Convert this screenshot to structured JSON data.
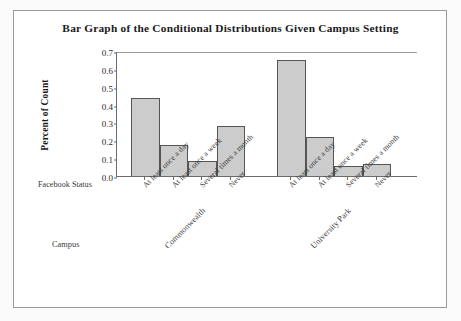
{
  "figure": {
    "title": "Bar Graph of the Conditional Distributions Given Campus Setting",
    "ylabel": "Percent of Count",
    "facebook_status_caption": "Facebook Status",
    "campus_caption": "Campus",
    "bar_fill_color": "#cccccc",
    "bar_border_color": "#555555",
    "axis_color": "#6b6b6b",
    "frame_color": "#9a9a9a",
    "background_color": "#ffffff"
  },
  "chart_data": {
    "type": "bar",
    "title": "Bar Graph of the Conditional Distributions Given Campus Setting",
    "xlabel": "Facebook Status",
    "ylabel": "Percent of Count",
    "ylim": [
      0.0,
      0.7
    ],
    "yticks": [
      "0.0",
      "0.1",
      "0.2",
      "0.3",
      "0.4",
      "0.5",
      "0.6",
      "0.7"
    ],
    "ytick_values": [
      0.0,
      0.1,
      0.2,
      0.3,
      0.4,
      0.5,
      0.6,
      0.7
    ],
    "grid": false,
    "legend": "none",
    "group_label": "Campus",
    "categories": [
      "At least once a day",
      "At least once a week",
      "Several times a month",
      "Never"
    ],
    "groups": [
      {
        "name": "Commonwealth",
        "values": [
          0.445,
          0.181,
          0.091,
          0.284
        ]
      },
      {
        "name": "University Park",
        "values": [
          0.656,
          0.222,
          0.062,
          0.075
        ]
      }
    ]
  }
}
